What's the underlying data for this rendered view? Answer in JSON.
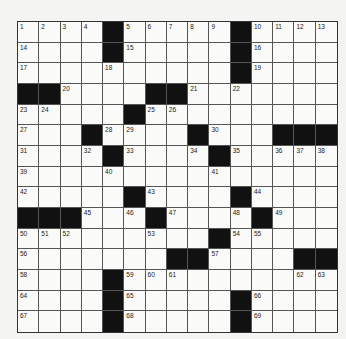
{
  "puzzle": {
    "rows": 15,
    "cols": 15,
    "grid": [
      "....#.....#....",
      "....#.....#....",
      "..........#....",
      "##....##.......",
      ".....#.........",
      "...#....#...###",
      "....#....#.....",
      "...............",
      ".....#....#....",
      "###...#....#...",
      ".........#.....",
      ".......##....##",
      "....#..........",
      "....#.....#....",
      "....#.....#...."
    ],
    "numbers": [
      {
        "r": 0,
        "c": 0,
        "n": "1"
      },
      {
        "r": 0,
        "c": 1,
        "n": "2"
      },
      {
        "r": 0,
        "c": 2,
        "n": "3"
      },
      {
        "r": 0,
        "c": 3,
        "n": "4"
      },
      {
        "r": 0,
        "c": 5,
        "n": "5"
      },
      {
        "r": 0,
        "c": 6,
        "n": "6"
      },
      {
        "r": 0,
        "c": 7,
        "n": "7"
      },
      {
        "r": 0,
        "c": 8,
        "n": "8"
      },
      {
        "r": 0,
        "c": 9,
        "n": "9"
      },
      {
        "r": 0,
        "c": 11,
        "n": "10"
      },
      {
        "r": 0,
        "c": 12,
        "n": "11"
      },
      {
        "r": 0,
        "c": 13,
        "n": "12"
      },
      {
        "r": 0,
        "c": 14,
        "n": "13"
      },
      {
        "r": 1,
        "c": 0,
        "n": "14"
      },
      {
        "r": 1,
        "c": 5,
        "n": "15"
      },
      {
        "r": 1,
        "c": 11,
        "n": "16"
      },
      {
        "r": 2,
        "c": 0,
        "n": "17"
      },
      {
        "r": 2,
        "c": 4,
        "n": "18"
      },
      {
        "r": 2,
        "c": 11,
        "n": "19"
      },
      {
        "r": 3,
        "c": 2,
        "n": "20"
      },
      {
        "r": 3,
        "c": 8,
        "n": "21"
      },
      {
        "r": 3,
        "c": 10,
        "n": "22"
      },
      {
        "r": 4,
        "c": 0,
        "n": "23"
      },
      {
        "r": 4,
        "c": 1,
        "n": "24"
      },
      {
        "r": 4,
        "c": 6,
        "n": "25"
      },
      {
        "r": 4,
        "c": 7,
        "n": "26"
      },
      {
        "r": 5,
        "c": 0,
        "n": "27"
      },
      {
        "r": 5,
        "c": 4,
        "n": "28"
      },
      {
        "r": 5,
        "c": 5,
        "n": "29"
      },
      {
        "r": 5,
        "c": 9,
        "n": "30"
      },
      {
        "r": 6,
        "c": 0,
        "n": "31"
      },
      {
        "r": 6,
        "c": 3,
        "n": "32"
      },
      {
        "r": 6,
        "c": 5,
        "n": "33"
      },
      {
        "r": 6,
        "c": 8,
        "n": "34"
      },
      {
        "r": 6,
        "c": 10,
        "n": "35"
      },
      {
        "r": 6,
        "c": 12,
        "n": "36"
      },
      {
        "r": 6,
        "c": 13,
        "n": "37"
      },
      {
        "r": 6,
        "c": 14,
        "n": "38"
      },
      {
        "r": 7,
        "c": 0,
        "n": "39"
      },
      {
        "r": 7,
        "c": 4,
        "n": "40"
      },
      {
        "r": 7,
        "c": 9,
        "n": "41"
      },
      {
        "r": 8,
        "c": 0,
        "n": "42"
      },
      {
        "r": 8,
        "c": 6,
        "n": "43"
      },
      {
        "r": 8,
        "c": 11,
        "n": "44"
      },
      {
        "r": 9,
        "c": 3,
        "n": "45"
      },
      {
        "r": 9,
        "c": 5,
        "n": "46"
      },
      {
        "r": 9,
        "c": 7,
        "n": "47"
      },
      {
        "r": 9,
        "c": 10,
        "n": "48"
      },
      {
        "r": 9,
        "c": 12,
        "n": "49"
      },
      {
        "r": 10,
        "c": 0,
        "n": "50"
      },
      {
        "r": 10,
        "c": 1,
        "n": "51"
      },
      {
        "r": 10,
        "c": 2,
        "n": "52"
      },
      {
        "r": 10,
        "c": 6,
        "n": "53"
      },
      {
        "r": 10,
        "c": 10,
        "n": "54"
      },
      {
        "r": 10,
        "c": 11,
        "n": "55"
      },
      {
        "r": 11,
        "c": 0,
        "n": "56"
      },
      {
        "r": 11,
        "c": 9,
        "n": "57"
      },
      {
        "r": 12,
        "c": 0,
        "n": "58"
      },
      {
        "r": 12,
        "c": 5,
        "n": "59"
      },
      {
        "r": 12,
        "c": 6,
        "n": "60"
      },
      {
        "r": 12,
        "c": 7,
        "n": "61"
      },
      {
        "r": 12,
        "c": 13,
        "n": "62"
      },
      {
        "r": 12,
        "c": 14,
        "n": "63"
      },
      {
        "r": 13,
        "c": 0,
        "n": "64"
      },
      {
        "r": 13,
        "c": 5,
        "n": "65"
      },
      {
        "r": 13,
        "c": 11,
        "n": "66"
      },
      {
        "r": 14,
        "c": 0,
        "n": "67"
      },
      {
        "r": 14,
        "c": 5,
        "n": "68"
      },
      {
        "r": 14,
        "c": 11,
        "n": "69"
      }
    ]
  }
}
